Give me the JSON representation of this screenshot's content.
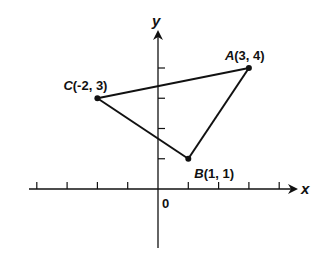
{
  "diagram": {
    "type": "coordinate-plane-triangle",
    "origin_label": "0",
    "x_axis": {
      "label": "x",
      "min": -4,
      "max": 4,
      "ticks": [
        -4,
        -3,
        -2,
        -1,
        1,
        2,
        3,
        4
      ]
    },
    "y_axis": {
      "label": "y",
      "min": -2,
      "max": 5,
      "ticks": [
        1,
        2,
        3,
        4
      ]
    },
    "points": [
      {
        "name": "A",
        "x": 3,
        "y": 4,
        "coord_text": "(3, 4)"
      },
      {
        "name": "B",
        "x": 1,
        "y": 1,
        "coord_text": "(1, 1)"
      },
      {
        "name": "C",
        "x": -2,
        "y": 3,
        "coord_text": "(-2, 3)"
      }
    ],
    "segments": [
      [
        "C",
        "A"
      ],
      [
        "A",
        "B"
      ],
      [
        "B",
        "C"
      ]
    ],
    "colors": {
      "ink": "#111111",
      "background": "#ffffff"
    }
  }
}
